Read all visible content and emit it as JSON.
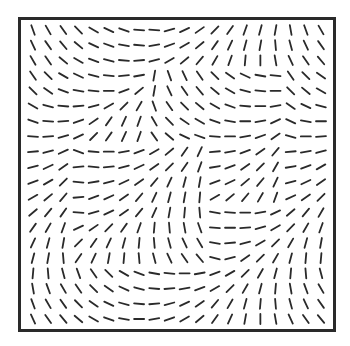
{
  "figure": {
    "type": "orientation-field",
    "grid": {
      "rows": 20,
      "cols": 20
    },
    "stroke_color": "#2a2a2a",
    "frame_color": "#2a2a2a",
    "angle_convention": "degrees from horizontal, positive = counter-clockwise ('/'), negative = clockwise ('\\'), 90 = vertical",
    "orientations": [
      [
        -70,
        -60,
        -55,
        -45,
        -30,
        -25,
        -20,
        -5,
        -5,
        15,
        25,
        35,
        45,
        55,
        70,
        75,
        80,
        -80,
        -70,
        -60
      ],
      [
        -65,
        -55,
        -50,
        -40,
        -25,
        -20,
        -10,
        -5,
        10,
        20,
        30,
        40,
        55,
        65,
        75,
        80,
        -85,
        -75,
        -65,
        -55
      ],
      [
        -60,
        -55,
        -40,
        -30,
        -20,
        -15,
        -5,
        5,
        15,
        30,
        40,
        50,
        60,
        70,
        85,
        90,
        -80,
        -65,
        -55,
        -50
      ],
      [
        -55,
        -45,
        -30,
        -25,
        -15,
        -5,
        5,
        10,
        80,
        -70,
        -65,
        -55,
        -45,
        -35,
        -25,
        -10,
        -5,
        -55,
        -45,
        -35
      ],
      [
        -45,
        -35,
        -20,
        -10,
        -5,
        0,
        20,
        40,
        80,
        -65,
        -55,
        -50,
        -40,
        -30,
        -15,
        -5,
        0,
        -45,
        -40,
        -30
      ],
      [
        -30,
        -15,
        -5,
        5,
        15,
        30,
        45,
        60,
        -70,
        -55,
        -45,
        -40,
        -30,
        -20,
        -5,
        0,
        10,
        -35,
        -25,
        -15
      ],
      [
        -20,
        -5,
        5,
        20,
        35,
        55,
        65,
        70,
        -60,
        -45,
        -35,
        -30,
        -20,
        -10,
        0,
        10,
        25,
        -25,
        -10,
        0
      ],
      [
        -5,
        5,
        15,
        25,
        45,
        55,
        65,
        70,
        -55,
        -40,
        -25,
        -20,
        -5,
        0,
        10,
        20,
        35,
        -15,
        0,
        5
      ],
      [
        5,
        15,
        25,
        -20,
        -5,
        0,
        10,
        20,
        30,
        40,
        55,
        65,
        5,
        10,
        20,
        35,
        50,
        5,
        10,
        15
      ],
      [
        15,
        25,
        35,
        5,
        -5,
        5,
        15,
        25,
        35,
        45,
        55,
        70,
        10,
        20,
        35,
        45,
        60,
        10,
        20,
        30
      ],
      [
        20,
        30,
        45,
        -5,
        10,
        15,
        25,
        35,
        50,
        65,
        75,
        80,
        20,
        25,
        40,
        50,
        65,
        15,
        25,
        35
      ],
      [
        30,
        40,
        50,
        5,
        20,
        25,
        35,
        50,
        65,
        75,
        80,
        85,
        30,
        40,
        50,
        60,
        70,
        25,
        35,
        45
      ],
      [
        40,
        50,
        55,
        -5,
        15,
        25,
        35,
        50,
        65,
        80,
        85,
        -85,
        -10,
        -5,
        0,
        10,
        25,
        40,
        50,
        60
      ],
      [
        55,
        60,
        70,
        25,
        35,
        45,
        55,
        70,
        85,
        -85,
        -80,
        -70,
        -5,
        0,
        5,
        15,
        30,
        45,
        60,
        70
      ],
      [
        65,
        75,
        80,
        45,
        55,
        65,
        75,
        85,
        -85,
        -75,
        -65,
        -60,
        -10,
        5,
        15,
        30,
        45,
        60,
        75,
        80
      ],
      [
        75,
        80,
        -85,
        55,
        65,
        80,
        85,
        -85,
        -75,
        -65,
        -55,
        -50,
        -15,
        15,
        35,
        45,
        60,
        75,
        85,
        85
      ],
      [
        85,
        -85,
        -75,
        -70,
        -55,
        -45,
        -30,
        -20,
        -10,
        -5,
        0,
        10,
        20,
        30,
        45,
        60,
        75,
        85,
        -85,
        -75
      ],
      [
        -80,
        -70,
        -60,
        -55,
        -45,
        -35,
        -25,
        -15,
        -5,
        5,
        10,
        20,
        30,
        45,
        60,
        75,
        85,
        -80,
        -70,
        -60
      ],
      [
        -70,
        -60,
        -55,
        -45,
        -35,
        -25,
        -15,
        -5,
        5,
        15,
        25,
        35,
        50,
        60,
        75,
        85,
        -85,
        -75,
        -65,
        -55
      ],
      [
        -65,
        -55,
        -50,
        -40,
        -30,
        -20,
        -10,
        0,
        10,
        20,
        30,
        40,
        55,
        65,
        80,
        90,
        -80,
        -65,
        -55,
        -50
      ]
    ]
  }
}
